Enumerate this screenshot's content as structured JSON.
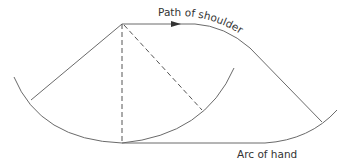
{
  "diagram": {
    "labels": {
      "shoulder_path": "Path of shoulder",
      "hand_arc": "Arc of hand"
    },
    "colors": {
      "line": "#6a6a6a",
      "dashed_line": "#555555",
      "text": "#333333",
      "background": "#ffffff"
    },
    "elements": [
      "left-arc",
      "left-arm-line",
      "vertical-dashed-line",
      "diagonal-dashed-line",
      "middle-arc",
      "shoulder-path-with-arrow",
      "right-arm-line",
      "right-arc"
    ]
  }
}
